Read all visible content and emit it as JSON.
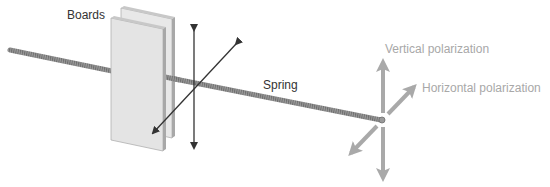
{
  "labels": {
    "boards": "Boards",
    "spring": "Spring",
    "vertical_polarization": "Vertical polarization",
    "horizontal_polarization": "Horizontal polarization"
  },
  "colors": {
    "background": "#ffffff",
    "spring": "#8a8a8a",
    "board_face": "#e6e6e6",
    "board_edge": "#a0a0a0",
    "dark_arrow": "#333333",
    "light_arrow": "#a9a9a9",
    "dark_text": "#333333",
    "light_text": "#a8a8a8"
  }
}
